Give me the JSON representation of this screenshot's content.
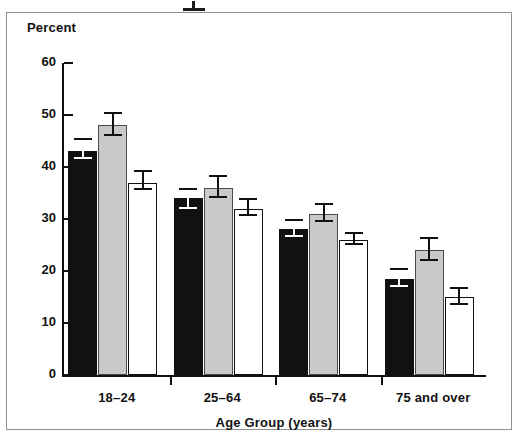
{
  "figure": {
    "y_axis_title": "Percent",
    "x_axis_title": "Age Group (years)",
    "legend_remnant_text": "cropped legend above figure"
  },
  "chart_data": {
    "type": "bar",
    "title": "",
    "xlabel": "Age Group (years)",
    "ylabel": "Percent",
    "ylim": [
      0,
      60
    ],
    "yticks": [
      0,
      10,
      20,
      30,
      40,
      50,
      60
    ],
    "ytick_labels": [
      "0",
      "10",
      "20",
      "30",
      "40",
      "50",
      "60"
    ],
    "grid": false,
    "legend_position": "above-plot-cropped",
    "categories": [
      "18–24",
      "25–64",
      "65–74",
      "75 and over"
    ],
    "series": [
      {
        "name": "series-1-black",
        "fill": "#111111",
        "values": [
          43.0,
          34.0,
          28.0,
          18.5
        ],
        "err_low": [
          41.5,
          32.0,
          26.5,
          17.0
        ],
        "err_high": [
          45.5,
          36.0,
          30.0,
          20.5
        ]
      },
      {
        "name": "series-2-gray",
        "fill": "#c9c9c9",
        "values": [
          48.0,
          36.0,
          31.0,
          24.0
        ],
        "err_low": [
          46.0,
          34.0,
          29.5,
          22.0
        ],
        "err_high": [
          50.5,
          38.5,
          33.0,
          26.5
        ]
      },
      {
        "name": "series-3-white",
        "fill": "#ffffff",
        "values": [
          37.0,
          32.0,
          26.0,
          15.0
        ],
        "err_low": [
          35.5,
          30.5,
          25.0,
          13.5
        ],
        "err_high": [
          39.5,
          34.0,
          27.5,
          17.0
        ]
      }
    ]
  }
}
